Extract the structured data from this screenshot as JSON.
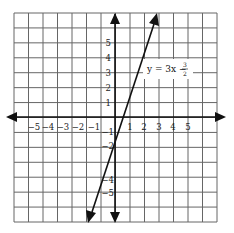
{
  "figure": {
    "type": "coordinate-plane-line-graph",
    "equation": {
      "text": "y = 3x − 3/2",
      "lhs": "y = 3x −",
      "numerator": "3",
      "denominator": "2"
    },
    "line": {
      "slope": 3,
      "intercept": -1.5
    },
    "grid": {
      "x_range": [
        -7,
        7
      ],
      "y_range": [
        -7,
        7
      ],
      "cell": 1
    },
    "x_tick_labels": [
      "−5",
      "−4",
      "−3",
      "−2",
      "−1",
      "1",
      "2",
      "3",
      "4",
      "5"
    ],
    "y_tick_labels_positive": [
      "5",
      "4",
      "3",
      "2",
      "1"
    ],
    "y_tick_labels_negative": [
      "−1",
      "−2",
      "−4",
      "−5"
    ],
    "colors": {
      "grid": "#555555",
      "axis": "#111111",
      "line": "#111111",
      "background": "#ffffff"
    }
  }
}
